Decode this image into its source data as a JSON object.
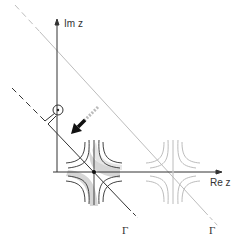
{
  "diagram": {
    "type": "complex-plane contour deformation (steepest descent)",
    "axes": {
      "imaginary_label": "Im z",
      "real_label": "Re z"
    },
    "contours": [
      {
        "name": "deformed-contour",
        "label": "Γ",
        "style": "dark solid with dashed ends, keyhole loop around branch point on Im axis"
      },
      {
        "name": "original-contour",
        "label": "Γ",
        "style": "light gray dashed/solid diagonal"
      }
    ],
    "saddle_points": [
      {
        "name": "active-saddle",
        "style": "dark hyperbolic level curves with gray shaded steepest-descent region, black dot"
      },
      {
        "name": "secondary-saddle",
        "style": "light gray hyperbolic level curves"
      }
    ],
    "annotations": {
      "arrow": "deformation direction arrow pointing down-left",
      "branch_point": "small circle with dot on Im axis"
    },
    "colors": {
      "dark": "#333333",
      "light": "#b8b8b8",
      "shade": "#d4d4d4"
    }
  }
}
